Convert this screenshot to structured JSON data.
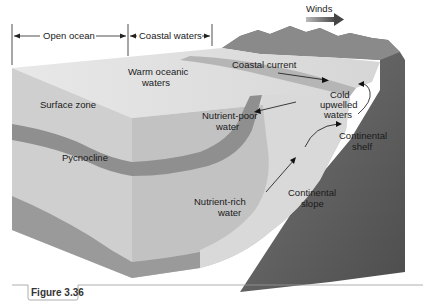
{
  "figure": {
    "caption": "Figure 3.36",
    "topic": "Coastal upwelling block diagram"
  },
  "header_ranges": {
    "open_ocean": "Open ocean",
    "coastal_waters": "Coastal waters"
  },
  "labels": {
    "winds": "Winds",
    "warm_oceanic_1": "Warm oceanic",
    "warm_oceanic_2": "waters",
    "coastal_current": "Coastal current",
    "surface_zone": "Surface zone",
    "nutrient_poor_1": "Nutrient-poor",
    "nutrient_poor_2": "water",
    "cold_upwelled_1": "Cold",
    "cold_upwelled_2": "upwelled",
    "cold_upwelled_3": "waters",
    "pycnocline": "Pycnocline",
    "continental_shelf_1": "Continental",
    "continental_shelf_2": "shelf",
    "nutrient_rich_1": "Nutrient-rich",
    "nutrient_rich_2": "water",
    "continental_slope_1": "Continental",
    "continental_slope_2": "slope"
  },
  "colors": {
    "ocean_top": "#e4e4e4",
    "ocean_front": "#c9c9c9",
    "ocean_side": "#bdbdbd",
    "pycnocline_band": "#8e8e8e",
    "land": "#6f6f6f",
    "land_dark": "#555555",
    "cold_water": "#d2d2d2",
    "caption_line": "#999999"
  }
}
